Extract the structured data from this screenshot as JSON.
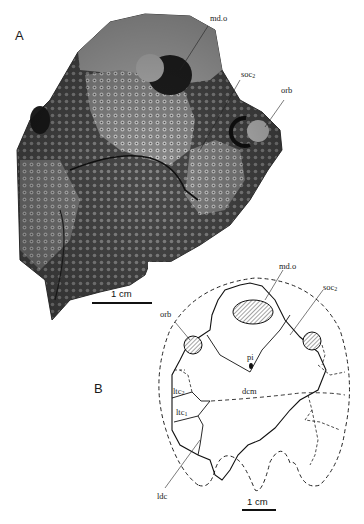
{
  "figure": {
    "panels": [
      {
        "id": "A",
        "type": "photograph",
        "description": "Fossil specimen photograph with tuberculated dermal ornament",
        "labels": [
          {
            "key": "mdo",
            "text": "md.o"
          },
          {
            "key": "soc2",
            "text": "soc",
            "sub": "2"
          },
          {
            "key": "orb",
            "text": "orb"
          }
        ],
        "scale_bar": "1 cm"
      },
      {
        "id": "B",
        "type": "interpretive drawing",
        "labels": [
          {
            "key": "mdo",
            "text": "md.o"
          },
          {
            "key": "soc2",
            "text": "soc",
            "sub": "2"
          },
          {
            "key": "orb",
            "text": "orb"
          },
          {
            "key": "pi",
            "text": "pi"
          },
          {
            "key": "dcm",
            "text": "dcm"
          },
          {
            "key": "ltc2",
            "text": "ltc",
            "sub": "2"
          },
          {
            "key": "ltc1",
            "text": "ltc",
            "sub": "1"
          },
          {
            "key": "ldc",
            "text": "ldc"
          }
        ],
        "scale_bar": "1 cm"
      }
    ]
  },
  "colors": {
    "ink": "#1a1a1a",
    "photo_dark": "#2a2a2a",
    "photo_mid": "#7a7a7a",
    "photo_light": "#bdbdbd"
  }
}
